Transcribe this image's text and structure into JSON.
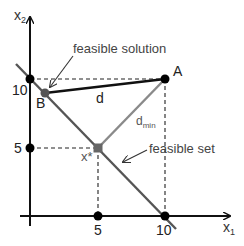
{
  "axes": {
    "x_label": "x",
    "x_sub": "1",
    "y_label": "x",
    "y_sub": "2",
    "x_ticks": [
      "5",
      "10"
    ],
    "y_ticks": [
      "5",
      "10"
    ]
  },
  "points": {
    "A": "A",
    "B": "B",
    "x_star": "x*"
  },
  "labels": {
    "feasible_solution": "feasible solution",
    "feasible_set": "feasible set",
    "d": "d",
    "d_min_base": "d",
    "d_min_sub": "min"
  },
  "colors": {
    "axis": "#111111",
    "feasible_line": "#555555",
    "d_min_line": "#8a8a8a",
    "point_dark": "#000000",
    "point_gray": "#666666",
    "text": "#333333",
    "text_gray": "#555555"
  }
}
